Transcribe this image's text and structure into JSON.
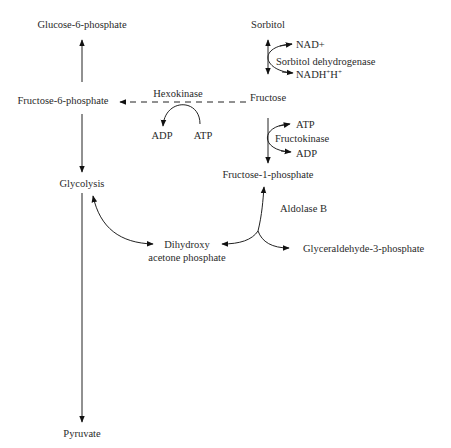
{
  "nodes": {
    "glucose6p": "Glucose-6-phosphate",
    "fructose6p": "Fructose-6-phosphate",
    "glycolysis": "Glycolysis",
    "pyruvate": "Pyruvate",
    "sorbitol": "Sorbitol",
    "fructose": "Fructose",
    "fructose1p": "Fructose-1-phosphate",
    "dhap_line1": "Dihydroxy",
    "dhap_line2": "acetone phosphate",
    "g3p": "Glyceraldehyde-3-phosphate"
  },
  "enzymes": {
    "hexokinase": "Hexokinase",
    "sorbitol_dh": "Sorbitol dehydrogenase",
    "fructokinase": "Fructokinase",
    "aldolase_b": "Aldolase B"
  },
  "cofactors": {
    "hexo_adp": "ADP",
    "hexo_atp": "ATP",
    "sdh_nad": "NAD+",
    "sdh_nadh_base": "NADH",
    "sdh_nadh_sup1": "+",
    "sdh_h": "H",
    "sdh_h_sup": "+",
    "fk_atp": "ATP",
    "fk_adp": "ADP"
  }
}
